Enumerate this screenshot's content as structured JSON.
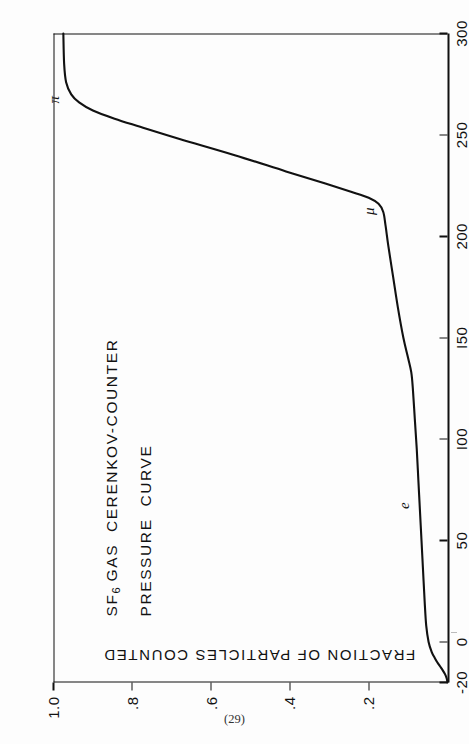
{
  "page": {
    "folio": "(29)",
    "orientation": "landscape-figure-on-portrait-page",
    "ink_color": "#111111",
    "paper_color": "#fdfdfd"
  },
  "chart_data": {
    "type": "line",
    "title": "SF6 GAS CERENKOV-COUNTER PRESSURE CURVE",
    "title_lines": [
      "SF",
      "6",
      " GAS  CERENKOV-COUNTER",
      "PRESSURE  CURVE"
    ],
    "title_line1_prefix": "SF",
    "title_line1_sub": "6",
    "title_line1_rest": " GAS  CERENKOV-COUNTER",
    "title_line2": "PRESSURE  CURVE",
    "subtitle": "",
    "xlabel": "PRESSURE  (psig)",
    "ylabel": "FRACTION OF PARTICLES COUNTED",
    "xlim": [
      -20,
      300
    ],
    "ylim": [
      0,
      1.0
    ],
    "grid": false,
    "legend_position": "none",
    "xticks": [
      -20,
      0,
      50,
      100,
      150,
      200,
      250,
      300
    ],
    "xticklabels": [
      "-20",
      "0",
      "50",
      "I00",
      "I50",
      "200",
      "250",
      "300"
    ],
    "yticks": [
      0,
      0.2,
      0.4,
      0.6,
      0.8,
      1.0
    ],
    "yticklabels": [
      "",
      ".2",
      ".4",
      ".6",
      ".8",
      "1.0"
    ],
    "series": [
      {
        "name": "fraction of particles counted",
        "x": [
          -20,
          -18,
          -16,
          -14,
          -12,
          -10,
          -8,
          -5,
          0,
          8,
          20,
          35,
          50,
          65,
          80,
          95,
          110,
          125,
          133,
          140,
          150,
          165,
          180,
          195,
          205,
          212,
          216,
          219,
          222,
          226,
          232,
          240,
          248,
          254,
          258,
          262,
          266,
          270,
          276,
          285,
          300
        ],
        "y": [
          0.0,
          0.002,
          0.006,
          0.012,
          0.019,
          0.026,
          0.032,
          0.04,
          0.048,
          0.054,
          0.058,
          0.062,
          0.066,
          0.07,
          0.074,
          0.078,
          0.083,
          0.088,
          0.092,
          0.1,
          0.112,
          0.126,
          0.138,
          0.15,
          0.157,
          0.163,
          0.175,
          0.2,
          0.245,
          0.31,
          0.41,
          0.54,
          0.68,
          0.78,
          0.845,
          0.9,
          0.935,
          0.955,
          0.968,
          0.973,
          0.975
        ]
      }
    ],
    "annotations": [
      {
        "label": "e",
        "x": 68,
        "y": 0.072,
        "meaning": "electron threshold plateau"
      },
      {
        "label": "μ",
        "x": 213,
        "y": 0.16,
        "meaning": "muon threshold"
      },
      {
        "label": "π",
        "x": 268,
        "y": 0.96,
        "meaning": "pion threshold plateau"
      }
    ]
  }
}
